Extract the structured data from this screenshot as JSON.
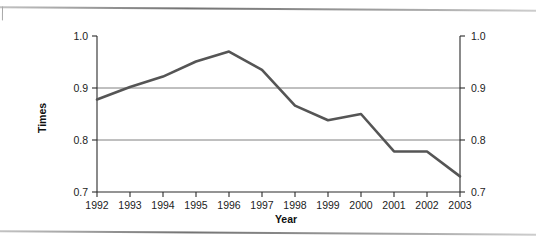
{
  "page": {
    "top_rule": "horizontal-rule",
    "bottom_rule": "horizontal-rule"
  },
  "chart_data": {
    "type": "line",
    "title": "",
    "xlabel": "Year",
    "ylabel": "Times",
    "ylabel_right": "Times",
    "categories": [
      "1992",
      "1993",
      "1994",
      "1995",
      "1996",
      "1997",
      "1998",
      "1999",
      "2000",
      "2001",
      "2002",
      "2003"
    ],
    "x": [
      1992,
      1993,
      1994,
      1995,
      1996,
      1997,
      1998,
      1999,
      2000,
      2001,
      2002,
      2003
    ],
    "values": [
      0.878,
      0.902,
      0.922,
      0.951,
      0.97,
      0.935,
      0.866,
      0.838,
      0.85,
      0.778,
      0.778,
      0.73
    ],
    "series": [
      {
        "name": "Times",
        "values": [
          0.878,
          0.902,
          0.922,
          0.951,
          0.97,
          0.935,
          0.866,
          0.838,
          0.85,
          0.778,
          0.778,
          0.73
        ]
      }
    ],
    "ylim": [
      0.7,
      1.0
    ],
    "yticks": [
      0.7,
      0.8,
      0.9,
      1.0
    ],
    "ytick_labels": [
      "0.7",
      "0.8",
      "0.9",
      "1.0"
    ],
    "ytick_labels_right": [
      "0.7",
      "0.8",
      "0.9",
      "1.0"
    ],
    "xlim": [
      1992,
      2003
    ],
    "grid": "horizontal",
    "gridlines_at": [
      0.8,
      0.9
    ],
    "legend": "none",
    "dual_y_axis": true,
    "line_color": "#555555",
    "grid_color": "#808080",
    "axis_color": "#2b2b2b",
    "background": "#ffffff"
  },
  "labels": {
    "y_axis_title": "Times",
    "x_axis_title": "Year",
    "y_left": [
      "1.0",
      "0.9",
      "0.8",
      "0.7"
    ],
    "y_right": [
      "1.0",
      "0.9",
      "0.8",
      "0.7"
    ],
    "x_ticks": [
      "1992",
      "1993",
      "1994",
      "1995",
      "1996",
      "1997",
      "1998",
      "1999",
      "2000",
      "2001",
      "2002",
      "2003"
    ]
  }
}
